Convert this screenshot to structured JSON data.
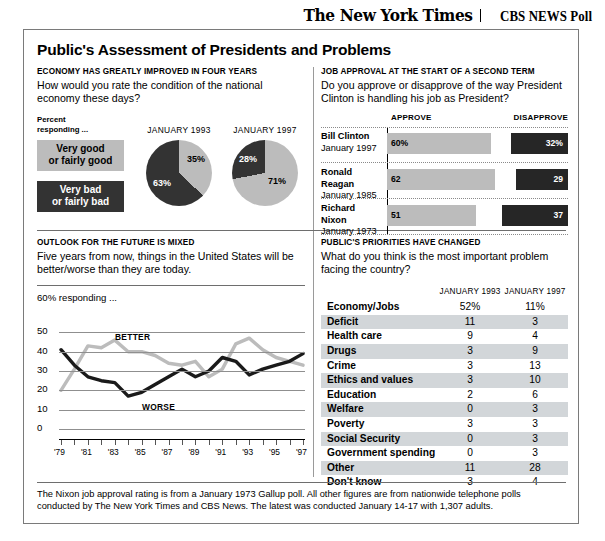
{
  "masthead": {
    "nyt": "The New York Times",
    "cbs": "CBS NEWS Poll"
  },
  "title": "Public's Assessment of Presidents and Problems",
  "economy": {
    "kicker": "ECONOMY HAS GREATLY IMPROVED IN FOUR YEARS",
    "question": "How would you rate the condition of the national economy these days?",
    "legend_head": "Percent\nresponding ...",
    "legend_head_line1": "Percent",
    "legend_head_line2": "responding ...",
    "legend": [
      {
        "label_line1": "Very good",
        "label_line2": "or fairly good",
        "color": "#bcbcbc"
      },
      {
        "label_line1": "Very bad",
        "label_line2": "or fairly bad",
        "color": "#333333"
      }
    ],
    "pies": [
      {
        "date": "JANUARY 1993",
        "good": 35,
        "bad": 63,
        "good_label": "35%",
        "bad_label": "63%"
      },
      {
        "date": "JANUARY 1997",
        "good": 71,
        "bad": 28,
        "good_label": "71%",
        "bad_label": "28%"
      }
    ]
  },
  "approval": {
    "kicker": "JOB APPROVAL AT THE START OF A SECOND TERM",
    "question": "Do you approve or disapprove of the way President Clinton is handling his job as President?",
    "col_approve": "APPROVE",
    "col_disapprove": "DISAPPROVE",
    "rows": [
      {
        "name": "Bill Clinton",
        "date": "January 1997",
        "approve": 60,
        "approve_label": "60%",
        "disapprove": 32,
        "disapprove_label": "32%"
      },
      {
        "name": "Ronald Reagan",
        "date": "January 1985",
        "approve": 62,
        "approve_label": "62",
        "disapprove": 29,
        "disapprove_label": "29"
      },
      {
        "name": "Richard Nixon",
        "date": "January 1973",
        "approve": 51,
        "approve_label": "51",
        "disapprove": 37,
        "disapprove_label": "37"
      }
    ]
  },
  "outlook": {
    "kicker": "OUTLOOK FOR THE FUTURE IS MIXED",
    "question": "Five years from now, things in the United States will be better/worse than they are today.",
    "resp_label": "60% responding ...",
    "series_better_label": "BETTER",
    "series_worse_label": "WORSE"
  },
  "priorities": {
    "kicker": "PUBLIC'S PRIORITIES HAVE CHANGED",
    "question": "What do you think is the most important problem facing the country?",
    "col1": "JANUARY 1993",
    "col2": "JANUARY 1997",
    "rows": [
      {
        "label": "Economy/Jobs",
        "v1": "52%",
        "v2": "11%"
      },
      {
        "label": "Deficit",
        "v1": "11",
        "v2": "3"
      },
      {
        "label": "Health care",
        "v1": "9",
        "v2": "4"
      },
      {
        "label": "Drugs",
        "v1": "3",
        "v2": "9"
      },
      {
        "label": "Crime",
        "v1": "3",
        "v2": "13"
      },
      {
        "label": "Ethics and values",
        "v1": "3",
        "v2": "10"
      },
      {
        "label": "Education",
        "v1": "2",
        "v2": "6"
      },
      {
        "label": "Welfare",
        "v1": "0",
        "v2": "3"
      },
      {
        "label": "Poverty",
        "v1": "3",
        "v2": "3"
      },
      {
        "label": "Social Security",
        "v1": "0",
        "v2": "3"
      },
      {
        "label": "Government spending",
        "v1": "0",
        "v2": "3"
      },
      {
        "label": "Other",
        "v1": "11",
        "v2": "28"
      },
      {
        "label": "Don't know",
        "v1": "3",
        "v2": "4"
      }
    ]
  },
  "footnote": "The Nixon job approval rating is from a January 1973 Gallup poll. All other figures are from nationwide telephone polls conducted by The New York Times and CBS News. The latest was conducted January 14-17 with 1,307 adults.",
  "chart_data": [
    {
      "type": "pie",
      "title": "JANUARY 1993",
      "labels": [
        "Very bad or fairly bad",
        "Very good or fairly good"
      ],
      "values": [
        63,
        35
      ],
      "colors": [
        "#333333",
        "#bcbcbc"
      ]
    },
    {
      "type": "pie",
      "title": "JANUARY 1997",
      "labels": [
        "Very bad or fairly bad",
        "Very good or fairly good"
      ],
      "values": [
        28,
        71
      ],
      "colors": [
        "#333333",
        "#bcbcbc"
      ]
    },
    {
      "type": "bar",
      "title": "Job approval at the start of a second term",
      "orientation": "horizontal",
      "categories": [
        "Bill Clinton January 1997",
        "Ronald Reagan January 1985",
        "Richard Nixon January 1973"
      ],
      "series": [
        {
          "name": "APPROVE",
          "values": [
            60,
            62,
            51
          ],
          "color": "#bcbcbc"
        },
        {
          "name": "DISAPPROVE",
          "values": [
            32,
            29,
            37
          ],
          "color": "#262626"
        }
      ],
      "xlabel": "",
      "ylabel": "",
      "xlim": [
        0,
        100
      ]
    },
    {
      "type": "line",
      "title": "OUTLOOK FOR THE FUTURE IS MIXED",
      "subtitle": "Five years from now, things in the United States will be better/worse than they are today.",
      "ylabel": "60% responding ...",
      "xlabel": "",
      "ylim": [
        0,
        60
      ],
      "yticks": [
        0,
        10,
        20,
        30,
        40,
        50
      ],
      "grid": true,
      "legend": "inline-annotations",
      "x": [
        "'79",
        "'80",
        "'81",
        "'82",
        "'83",
        "'84",
        "'85",
        "'86",
        "'87",
        "'88",
        "'89",
        "'90",
        "'91",
        "'92",
        "'93",
        "'94",
        "'95",
        "'96",
        "'97"
      ],
      "xtick_labels": [
        "'79",
        "'81",
        "'83",
        "'85",
        "'87",
        "'89",
        "'91",
        "'93",
        "'95",
        "'97"
      ],
      "series": [
        {
          "name": "BETTER",
          "color": "#bcbcbc",
          "values": [
            20,
            31,
            43,
            42,
            46,
            40,
            40,
            38,
            34,
            33,
            35,
            27,
            31,
            44,
            47,
            41,
            37,
            35,
            33
          ]
        },
        {
          "name": "WORSE",
          "color": "#1a1a1a",
          "values": [
            41,
            33,
            27,
            25,
            24,
            17,
            19,
            23,
            27,
            31,
            27,
            30,
            37,
            35,
            28,
            31,
            33,
            35,
            39
          ]
        }
      ]
    },
    {
      "type": "table",
      "title": "PUBLIC'S PRIORITIES HAVE CHANGED",
      "columns": [
        "",
        "JANUARY 1993",
        "JANUARY 1997"
      ],
      "rows": [
        [
          "Economy/Jobs",
          "52%",
          "11%"
        ],
        [
          "Deficit",
          "11",
          "3"
        ],
        [
          "Health care",
          "9",
          "4"
        ],
        [
          "Drugs",
          "3",
          "9"
        ],
        [
          "Crime",
          "3",
          "13"
        ],
        [
          "Ethics and values",
          "3",
          "10"
        ],
        [
          "Education",
          "2",
          "6"
        ],
        [
          "Welfare",
          "0",
          "3"
        ],
        [
          "Poverty",
          "3",
          "3"
        ],
        [
          "Social Security",
          "0",
          "3"
        ],
        [
          "Government spending",
          "0",
          "3"
        ],
        [
          "Other",
          "11",
          "28"
        ],
        [
          "Don't know",
          "3",
          "4"
        ]
      ]
    }
  ]
}
